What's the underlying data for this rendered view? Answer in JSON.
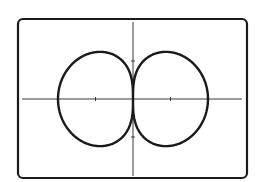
{
  "chart_data": {
    "type": "line",
    "title": "",
    "xlabel": "",
    "ylabel": "",
    "curve": "polar r = sqrt(|cos θ|)",
    "xlim": [
      -1.5,
      1.5
    ],
    "ylim": [
      -1.05,
      1.05
    ],
    "x_ticks": [
      -0.5,
      0.5
    ],
    "y_ticks": [
      -0.5,
      0.5
    ],
    "x_extent": [
      -1,
      1
    ],
    "y_extent": [
      -0.62,
      0.62
    ],
    "grid": false,
    "legend": null,
    "key_points": [
      {
        "x": -1,
        "y": 0
      },
      {
        "x": 1,
        "y": 0
      },
      {
        "x": 0,
        "y": 0
      },
      {
        "x": -0.44,
        "y": 0.62
      },
      {
        "x": 0.44,
        "y": 0.62
      },
      {
        "x": -0.44,
        "y": -0.62
      },
      {
        "x": 0.44,
        "y": -0.62
      }
    ]
  },
  "layout": {
    "frame": {
      "x": 18,
      "y": 19,
      "w": 229,
      "h": 159,
      "radius": 5
    },
    "origin_px": {
      "x": 133,
      "y": 99
    },
    "unit_px": {
      "x": 75,
      "y": 76
    },
    "x_axis_px": [
      22,
      242
    ],
    "y_axis_px": [
      22,
      176
    ],
    "colors": {
      "stroke": "#1a1a1a",
      "axis": "#3a3a3a",
      "background": "#ffffff"
    }
  }
}
